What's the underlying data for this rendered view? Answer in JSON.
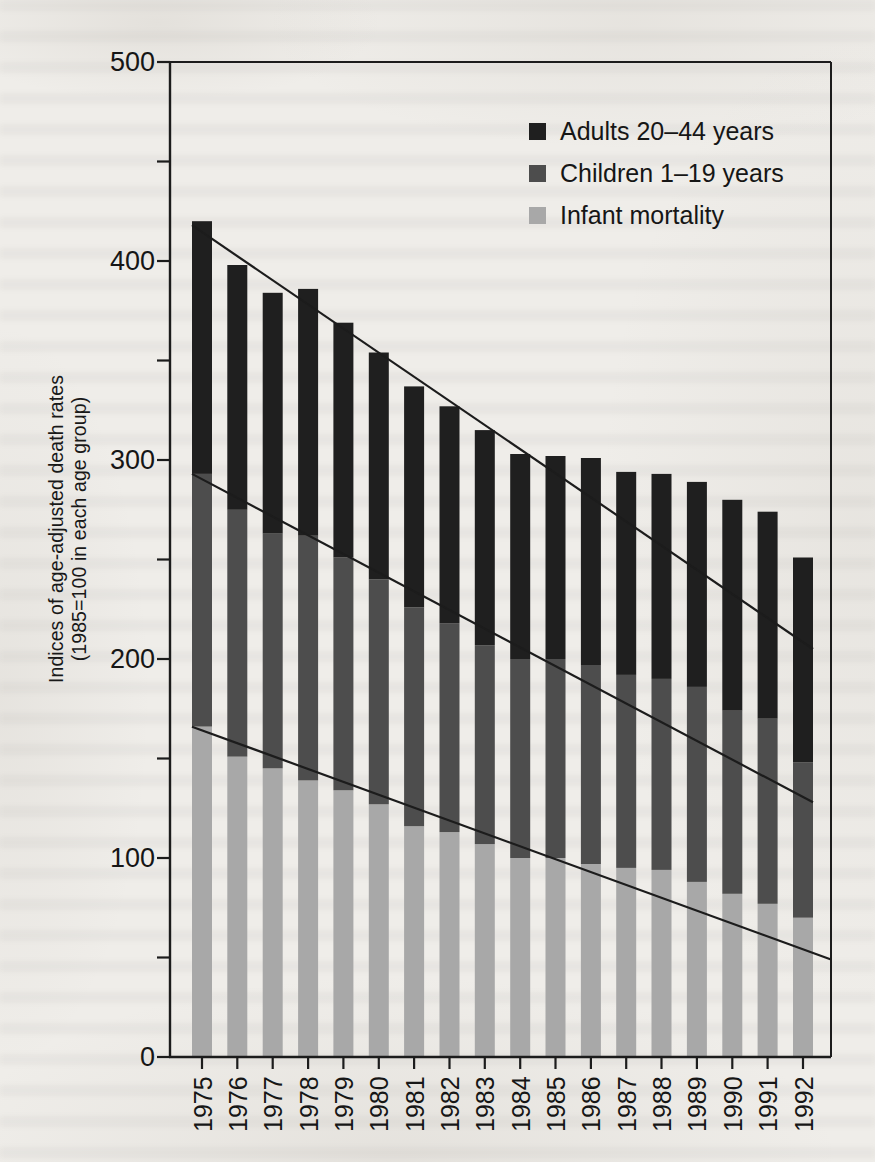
{
  "figure": {
    "y_axis_title_line1": "Indices of age-adjusted death rates",
    "y_axis_title_line2": "(1985=100 in each age group)",
    "legend": [
      {
        "label": "Adults 20–44 years",
        "color": "#1f1f1f"
      },
      {
        "label": "Children 1–19 years",
        "color": "#4d4d4d"
      },
      {
        "label": "Infant mortality",
        "color": "#a8a8a8"
      }
    ]
  },
  "chart_data": {
    "type": "bar",
    "stacked": true,
    "title": "",
    "xlabel": "",
    "ylabel": "Indices of age-adjusted death rates (1985=100 in each age group)",
    "ylim": [
      0,
      500
    ],
    "ytick_minor_step": 50,
    "ytick_label_step": 100,
    "grid": false,
    "legend_position": "top-right",
    "categories": [
      "1975",
      "1976",
      "1977",
      "1978",
      "1979",
      "1980",
      "1981",
      "1982",
      "1983",
      "1984",
      "1985",
      "1986",
      "1987",
      "1988",
      "1989",
      "1990",
      "1991",
      "1992"
    ],
    "series": [
      {
        "name": "Infant mortality",
        "color": "#a8a8a8",
        "values": [
          166,
          151,
          145,
          139,
          134,
          127,
          116,
          113,
          107,
          100,
          100,
          97,
          95,
          94,
          88,
          82,
          77,
          70
        ]
      },
      {
        "name": "Children 1–19 years",
        "color": "#4d4d4d",
        "values": [
          127,
          124,
          118,
          123,
          117,
          113,
          110,
          105,
          100,
          100,
          100,
          100,
          97,
          96,
          98,
          92,
          93,
          78
        ]
      },
      {
        "name": "Adults 20–44 years",
        "color": "#1f1f1f",
        "values": [
          127,
          123,
          121,
          124,
          118,
          114,
          111,
          109,
          108,
          103,
          102,
          104,
          102,
          103,
          103,
          106,
          104,
          103
        ]
      }
    ],
    "stack_totals": [
      420,
      398,
      384,
      386,
      369,
      354,
      337,
      327,
      315,
      303,
      302,
      301,
      294,
      293,
      289,
      280,
      274,
      251
    ],
    "trend_lines": [
      {
        "name": "total-trend",
        "from_x": "1975-left",
        "from_value": 418,
        "to_x": "1992-right",
        "to_value": 205
      },
      {
        "name": "children-boundary-trend",
        "from_x": "1975-left",
        "from_value": 293,
        "to_x": "1992-right",
        "to_value": 128
      },
      {
        "name": "infant-boundary-trend",
        "from_x": "1975-left",
        "from_value": 166,
        "to_x": "right-border",
        "to_value": 49
      }
    ],
    "axis_color": "#1c1c1c"
  }
}
